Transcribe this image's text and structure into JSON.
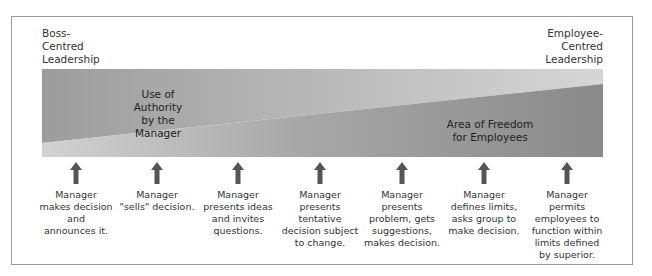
{
  "diagram": {
    "left_end_label": "Boss-\nCentred\nLeadership",
    "right_end_label": "Employee-\nCentred\nLeadership",
    "regions": {
      "authority_label": "Use of Authority\nby the Manager",
      "freedom_label": "Area of Freedom\nfor Employees"
    },
    "colors": {
      "authority_fill": "#a3a3a3",
      "freedom_fill": "#8e8e8e",
      "arrow_fill": "#555555",
      "frame_border": "#9a9a9a"
    },
    "steps": [
      {
        "label": "Manager\nmakes decision\nand\nannounces it."
      },
      {
        "label": "Manager\n\"sells\" decision."
      },
      {
        "label": "Manager\npresents ideas\nand invites\nquestions."
      },
      {
        "label": "Manager\npresents\ntentative\ndecision subject\nto change."
      },
      {
        "label": "Manager\npresents\nproblem, gets\nsuggestions,\nmakes decision."
      },
      {
        "label": "Manager\ndefines limits,\nasks group to\nmake decision."
      },
      {
        "label": "Manager\npermits\nemployees to\nfunction within\nlimits defined\nby superior."
      }
    ]
  }
}
